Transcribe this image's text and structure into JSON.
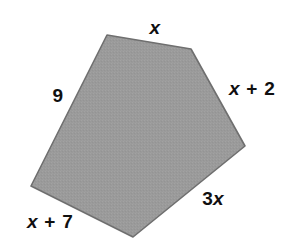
{
  "figure": {
    "type": "geometry-diagram",
    "shape_name": "pentagon",
    "background_color": "#ffffff",
    "fill_color": "#9a9a9a",
    "stroke_color": "#6f6f6f",
    "text_color": "#101010",
    "width": 291,
    "height": 239,
    "vertices": [
      {
        "name": "top-left-vertex",
        "x": 107,
        "y": 35
      },
      {
        "name": "top-right-vertex",
        "x": 191,
        "y": 49
      },
      {
        "name": "right-vertex",
        "x": 245,
        "y": 146
      },
      {
        "name": "bottom-vertex",
        "x": 133,
        "y": 237
      },
      {
        "name": "left-vertex",
        "x": 31,
        "y": 186
      }
    ],
    "labels": [
      {
        "name": "side-label-top",
        "text": "x",
        "parts": [
          {
            "kind": "var",
            "text": "x"
          }
        ],
        "x": 155,
        "y": 27,
        "side": "top"
      },
      {
        "name": "side-label-right",
        "text": "x + 2",
        "parts": [
          {
            "kind": "var",
            "text": "x"
          },
          {
            "kind": "op",
            "text": " + "
          },
          {
            "kind": "num",
            "text": "2"
          }
        ],
        "x": 252,
        "y": 88,
        "side": "upper-right"
      },
      {
        "name": "side-label-lower-right",
        "text": "3x",
        "parts": [
          {
            "kind": "num",
            "text": "3"
          },
          {
            "kind": "var",
            "text": "x"
          }
        ],
        "x": 213,
        "y": 198,
        "side": "lower-right"
      },
      {
        "name": "side-label-bottom-left",
        "text": "x + 7",
        "parts": [
          {
            "kind": "var",
            "text": "x"
          },
          {
            "kind": "op",
            "text": " + "
          },
          {
            "kind": "num",
            "text": "7"
          }
        ],
        "x": 50,
        "y": 221,
        "side": "lower-left"
      },
      {
        "name": "side-label-left",
        "text": "9",
        "parts": [
          {
            "kind": "num",
            "text": "9"
          }
        ],
        "x": 58,
        "y": 95,
        "side": "upper-left"
      }
    ]
  }
}
